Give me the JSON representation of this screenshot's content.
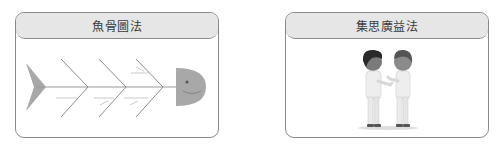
{
  "cards": [
    {
      "title": "魚骨圖法",
      "illustration": "fishbone-diagram-icon"
    },
    {
      "title": "集思廣益法",
      "illustration": "two-people-discussing-icon"
    }
  ],
  "colors": {
    "border": "#8a8a8a",
    "header_bg": "#e6e6e6",
    "fish_gray": "#a8a8a8",
    "hair_dark": "#2a2a2a",
    "hair_brown": "#555555"
  }
}
